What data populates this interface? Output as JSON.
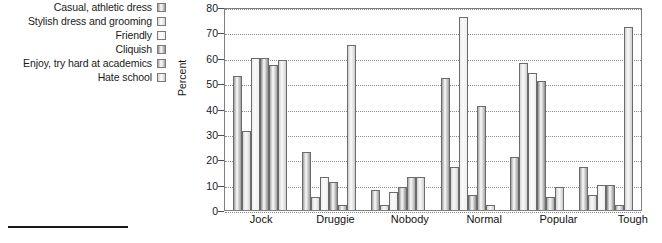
{
  "chart_data": {
    "type": "bar",
    "title": "",
    "xlabel": "",
    "ylabel": "Percent",
    "ylim": [
      0,
      80
    ],
    "ytick_step": 10,
    "yticks": [
      "80",
      "70",
      "60",
      "50",
      "40",
      "30",
      "20",
      "10",
      "0"
    ],
    "grid": true,
    "legend_position": "left",
    "categories": [
      "Jock",
      "Druggie",
      "Nobody",
      "Normal",
      "Popular",
      "Tough"
    ],
    "series": [
      {
        "name": "Casual, athletic dress",
        "color": "#9e9e9e",
        "values": [
          53,
          23,
          8,
          52,
          21,
          17
        ]
      },
      {
        "name": "Stylish dress and grooming",
        "color": "#d4d4d4",
        "values": [
          31,
          5,
          2,
          17,
          58,
          6
        ]
      },
      {
        "name": "Friendly",
        "color": "#ededed",
        "values": [
          60,
          13,
          7,
          76,
          54,
          10
        ]
      },
      {
        "name": "Cliquish",
        "color": "#8f8f8f",
        "values": [
          60,
          11,
          9,
          6,
          51,
          10
        ]
      },
      {
        "name": "Enjoy, try hard at academics",
        "color": "#a8a8a8",
        "values": [
          57,
          2,
          13,
          41,
          5,
          2
        ]
      },
      {
        "name": "Hate school",
        "color": "#cfcfcf",
        "values": [
          59,
          65,
          13,
          2,
          9,
          72
        ]
      }
    ]
  }
}
